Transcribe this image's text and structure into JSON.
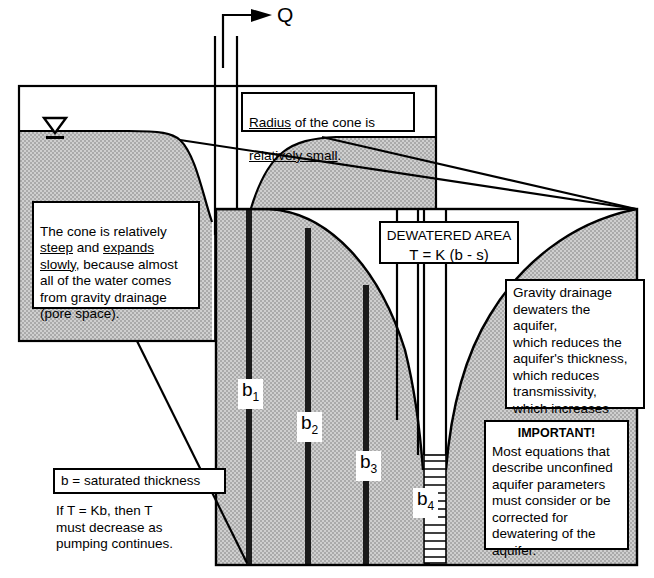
{
  "figure": {
    "pumping_rate_label": "Q",
    "water_table_symbol": "water-table-triangle"
  },
  "callouts": {
    "radius_box": {
      "line1_underline": "Radius",
      "line1_rest": " of the cone is",
      "line2_underline": "relatively small",
      "line2_rest": "."
    },
    "cone_box": {
      "seg1": "The cone is relatively\n",
      "u1": "steep",
      "seg2": " and ",
      "u2": "expands\nslowly",
      "seg3": ", because almost\nall of the water comes\nfrom gravity drainage\n(pore space)."
    },
    "dewatered_box": {
      "title": "DEWATERED AREA",
      "equation": "T = K (b - s)"
    },
    "gravity_box": {
      "text": "Gravity drainage\ndewaters the aquifer,\nwhich reduces the\naquifer's thickness,\nwhich reduces\ntransmissivity,\nwhich increases\ndrawdown."
    },
    "important_box": {
      "title": "IMPORTANT!",
      "text": "Most equations that\ndescribe unconfined\naquifer parameters\nmust consider or be\ncorrected for\ndewatering of the\naquifer."
    },
    "saturated_thickness_box": {
      "definition": "b = saturated thickness",
      "note": "If  T = Kb,  then  T\nmust decrease as\npumping continues."
    }
  },
  "thickness_labels": [
    {
      "base": "b",
      "sub": "1"
    },
    {
      "base": "b",
      "sub": "2"
    },
    {
      "base": "b",
      "sub": "3"
    },
    {
      "base": "b",
      "sub": "4"
    }
  ],
  "colors": {
    "aquifer_fill": "#c9c9c9",
    "line": "#000000",
    "background": "#ffffff",
    "well_bar": "#1a1a1a"
  }
}
